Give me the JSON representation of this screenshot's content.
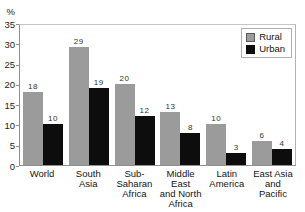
{
  "chart_data": {
    "type": "bar",
    "title": "",
    "ylabel": "%",
    "xlabel": "",
    "ylim": [
      0,
      35
    ],
    "yticks": [
      35,
      30,
      25,
      20,
      15,
      10,
      5,
      0
    ],
    "grid": false,
    "bar_value_labels": true,
    "categories": [
      "World",
      "South Asia",
      "Sub-Saharan Africa",
      "Middle East and North Africa",
      "Latin America",
      "East Asia and Pacific"
    ],
    "tick_labels": [
      "World",
      "South\nAsia",
      "Sub-\nSaharan\nAfrica",
      "Middle East\nand North\nAfrica",
      "Latin\nAmerica",
      "East Asia\nand Pacific"
    ],
    "series": [
      {
        "name": "Rural",
        "color": "#9b9b9b",
        "values": [
          18,
          29,
          20,
          13,
          10,
          6
        ]
      },
      {
        "name": "Urban",
        "color": "#0d0d0d",
        "values": [
          10,
          19,
          12,
          8,
          3,
          4
        ]
      }
    ],
    "legend": {
      "position": "top-right"
    }
  }
}
